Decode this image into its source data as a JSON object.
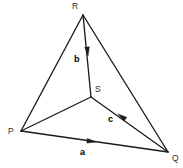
{
  "figure": {
    "name": "triangle-with-interior-point-vectors",
    "background_color": "#ffffff",
    "line_color": "#1b1b1b",
    "width": 183,
    "height": 168
  },
  "vertices": [
    {
      "id": "R",
      "label": "R",
      "x": 83,
      "y": 15,
      "label_x": 72,
      "label_y": 9
    },
    {
      "id": "P",
      "label": "P",
      "x": 21,
      "y": 131,
      "label_x": 8,
      "label_y": 134
    },
    {
      "id": "Q",
      "label": "Q",
      "x": 168,
      "y": 152,
      "label_x": 172,
      "label_y": 161
    },
    {
      "id": "S",
      "label": "S",
      "x": 91,
      "y": 97,
      "label_x": 95,
      "label_y": 92
    }
  ],
  "edges": [
    {
      "id": "RP",
      "from": "R",
      "to": "P",
      "x1": 83,
      "y1": 15,
      "x2": 21,
      "y2": 131
    },
    {
      "id": "RQ",
      "from": "R",
      "to": "Q",
      "x1": 83,
      "y1": 15,
      "x2": 168,
      "y2": 152
    },
    {
      "id": "PQ",
      "from": "P",
      "to": "Q",
      "x1": 21,
      "y1": 131,
      "x2": 168,
      "y2": 152
    },
    {
      "id": "RS",
      "from": "R",
      "to": "S",
      "x1": 83,
      "y1": 15,
      "x2": 91,
      "y2": 97
    },
    {
      "id": "PS",
      "from": "P",
      "to": "S",
      "x1": 21,
      "y1": 131,
      "x2": 91,
      "y2": 97
    },
    {
      "id": "SQ",
      "from": "S",
      "to": "Q",
      "x1": 91,
      "y1": 97,
      "x2": 168,
      "y2": 152
    }
  ],
  "vectors": [
    {
      "id": "a",
      "label": "a",
      "along_edge": "PQ",
      "direction": "P-to-Q",
      "label_x": 80,
      "label_y": 155,
      "arrow_tip_x": 96,
      "arrow_tip_y": 142,
      "arrow_angle_deg": 8
    },
    {
      "id": "b",
      "label": "b",
      "along_edge": "RS",
      "direction": "R-to-S",
      "label_x": 74,
      "label_y": 62,
      "arrow_tip_x": 88,
      "arrow_tip_y": 56,
      "arrow_angle_deg": 84
    },
    {
      "id": "c",
      "label": "c",
      "along_edge": "SQ",
      "direction": "Q-to-S",
      "label_x": 108,
      "label_y": 122,
      "arrow_tip_x": 118,
      "arrow_tip_y": 114,
      "arrow_angle_deg": 215
    }
  ]
}
